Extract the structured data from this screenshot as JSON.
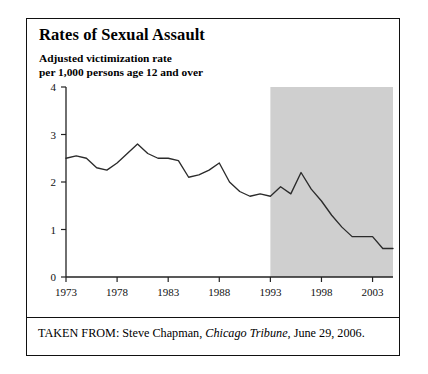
{
  "figure": {
    "title": "Rates of Sexual Assault",
    "subtitle_line1": "Adjusted victimization rate",
    "subtitle_line2": "per 1,000 persons age 12 and over",
    "caption_prefix": "TAKEN FROM: Steve Chapman, ",
    "caption_source": "Chicago Tribune",
    "caption_suffix": ", June 29, 2006."
  },
  "chart_data": {
    "type": "line",
    "title": "Rates of Sexual Assault",
    "subtitle": "Adjusted victimization rate per 1,000 persons age 12 and over",
    "xlabel": "",
    "ylabel": "",
    "xlim": [
      1973,
      2005
    ],
    "ylim": [
      0,
      4
    ],
    "yticks": [
      0,
      1,
      2,
      3,
      4
    ],
    "ytick_labels": [
      "0",
      "1",
      "2",
      "3",
      "4"
    ],
    "xticks": [
      1973,
      1978,
      1983,
      1988,
      1993,
      1998,
      2003
    ],
    "xtick_labels": [
      "1973",
      "1978",
      "1983",
      "1988",
      "1993",
      "1998",
      "2003"
    ],
    "grid": false,
    "legend": "none",
    "line_color": "#2b2b2b",
    "shaded_region": {
      "label": "shaded band",
      "x_start": 1993,
      "x_end": 2005,
      "y_start": 0,
      "y_end": 4,
      "color": "#cfcfcf"
    },
    "x": [
      1973,
      1974,
      1975,
      1976,
      1977,
      1978,
      1979,
      1980,
      1981,
      1982,
      1983,
      1984,
      1985,
      1986,
      1987,
      1988,
      1989,
      1990,
      1991,
      1992,
      1993,
      1994,
      1995,
      1996,
      1997,
      1998,
      1999,
      2000,
      2001,
      2002,
      2003,
      2004,
      2005
    ],
    "values": [
      2.5,
      2.55,
      2.5,
      2.3,
      2.25,
      2.4,
      2.6,
      2.8,
      2.6,
      2.5,
      2.5,
      2.45,
      2.1,
      2.15,
      2.25,
      2.4,
      2.0,
      1.8,
      1.7,
      1.75,
      1.7,
      1.9,
      1.75,
      2.2,
      1.85,
      1.6,
      1.3,
      1.05,
      0.85,
      0.85,
      0.85,
      0.6,
      0.6
    ],
    "series": [
      {
        "name": "Adjusted victimization rate per 1,000 persons age 12 and over",
        "values": [
          2.5,
          2.55,
          2.5,
          2.3,
          2.25,
          2.4,
          2.6,
          2.8,
          2.6,
          2.5,
          2.5,
          2.45,
          2.1,
          2.15,
          2.25,
          2.4,
          2.0,
          1.8,
          1.7,
          1.75,
          1.7,
          1.9,
          1.75,
          2.2,
          1.85,
          1.6,
          1.3,
          1.05,
          0.85,
          0.85,
          0.85,
          0.6,
          0.6
        ]
      }
    ]
  }
}
